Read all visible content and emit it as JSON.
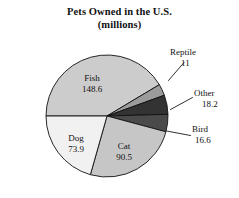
{
  "chart_data": {
    "type": "pie",
    "title": "Pets Owned in the U.S.",
    "subtitle": "(millions)",
    "units": "millions",
    "xlabel": "",
    "ylabel": "",
    "legend": "none",
    "grid": false,
    "total": 358.8,
    "categories": [
      "Fish",
      "Dog",
      "Cat",
      "Bird",
      "Other",
      "Reptile"
    ],
    "values": [
      148.6,
      73.9,
      90.5,
      16.6,
      18.2,
      11
    ],
    "slices": [
      {
        "name": "Fish",
        "label": "Fish",
        "value": 148.6,
        "value_text": "148.6",
        "color": "#cccccc",
        "label_position": "inside",
        "start_angle": 180,
        "end_angle": 329.1
      },
      {
        "name": "Reptile",
        "label": "Reptile",
        "value": 11,
        "value_text": "11",
        "color": "#9b9b9b",
        "label_position": "outside",
        "start_angle": 329.1,
        "end_angle": 340.1
      },
      {
        "name": "Other",
        "label": "Other",
        "value": 18.2,
        "value_text": "18.2",
        "color": "#333333",
        "label_position": "outside",
        "start_angle": 340.1,
        "end_angle": 358.4
      },
      {
        "name": "Bird",
        "label": "Bird",
        "value": 16.6,
        "value_text": "16.6",
        "color": "#4a4a4a",
        "label_position": "outside",
        "start_angle": 358.4,
        "end_angle": 375.0
      },
      {
        "name": "Cat",
        "label": "Cat",
        "value": 90.5,
        "value_text": "90.5",
        "color": "#c6c6c6",
        "label_position": "inside",
        "start_angle": 375.0,
        "end_angle": 465.8
      },
      {
        "name": "Dog",
        "label": "Dog",
        "value": 73.9,
        "value_text": "73.9",
        "color": "#f1f1f1",
        "label_position": "inside",
        "start_angle": 465.8,
        "end_angle": 540.0
      }
    ],
    "geometry": {
      "center_x": 107,
      "center_y": 116,
      "radius": 61,
      "start_angle_deg": 180,
      "direction": "clockwise"
    },
    "colors": {
      "outline": "#111111",
      "background": "#ffffff",
      "text": "#111111"
    }
  }
}
